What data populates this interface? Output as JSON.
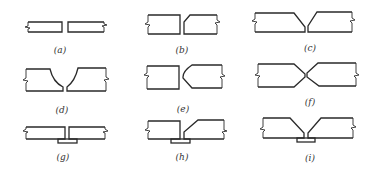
{
  "figure": {
    "panels": [
      {
        "id": "a",
        "label": "(a)",
        "type": "square-butt"
      },
      {
        "id": "b",
        "label": "(b)",
        "type": "single-bevel"
      },
      {
        "id": "c",
        "label": "(c)",
        "type": "single-V"
      },
      {
        "id": "d",
        "label": "(d)",
        "type": "single-U"
      },
      {
        "id": "e",
        "label": "(e)",
        "type": "single-J"
      },
      {
        "id": "f",
        "label": "(f)",
        "type": "double-V"
      },
      {
        "id": "g",
        "label": "(g)",
        "type": "square-butt-with-backing-strip"
      },
      {
        "id": "h",
        "label": "(h)",
        "type": "single-bevel-with-backing-strip"
      },
      {
        "id": "i",
        "label": "(i)",
        "type": "single-V-with-backing-strip"
      }
    ]
  }
}
